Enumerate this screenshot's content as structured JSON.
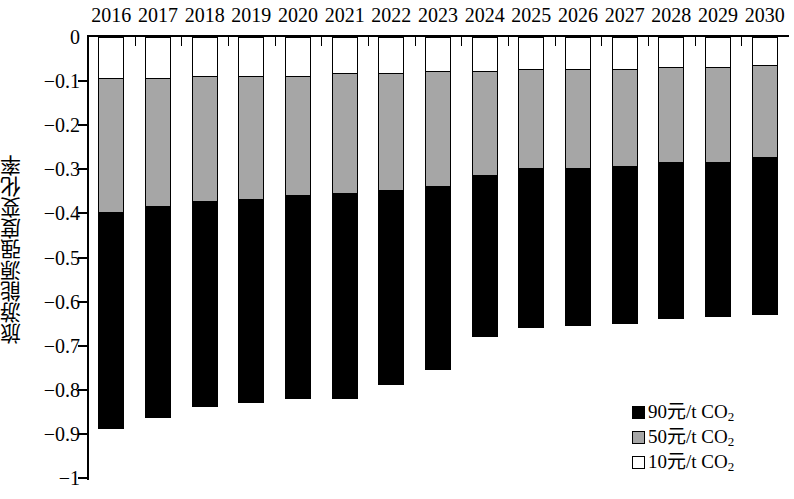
{
  "chart_data": {
    "type": "bar",
    "stacked": true,
    "orientation": "vertical-negative",
    "title": "",
    "subtitle": "",
    "xlabel": "",
    "ylabel": "旅游能源强度变化率",
    "xlim": [
      2016,
      2030
    ],
    "ylim": [
      -1,
      0
    ],
    "y_ticks": [
      "0",
      "−0.1",
      "−0.2",
      "−0.3",
      "−0.4",
      "−0.5",
      "−0.6",
      "−0.7",
      "−0.8",
      "−0.9",
      "−1"
    ],
    "y_tick_values": [
      0,
      -0.1,
      -0.2,
      -0.3,
      -0.4,
      -0.5,
      -0.6,
      -0.7,
      -0.8,
      -0.9,
      -1
    ],
    "grid": false,
    "x_axis_position": "top",
    "legend_position": "bottom-right",
    "categories": [
      "2016",
      "2017",
      "2018",
      "2019",
      "2020",
      "2021",
      "2022",
      "2023",
      "2024",
      "2025",
      "2026",
      "2027",
      "2028",
      "2029",
      "2030"
    ],
    "series": [
      {
        "name": "10元/t CO2",
        "color": "#ffffff",
        "legend_label_main": "10元/t CO",
        "legend_label_sub": "2",
        "values": [
          -0.095,
          -0.095,
          -0.09,
          -0.09,
          -0.09,
          -0.085,
          -0.085,
          -0.08,
          -0.08,
          -0.075,
          -0.075,
          -0.075,
          -0.07,
          -0.07,
          -0.065
        ]
      },
      {
        "name": "50元/t CO2",
        "color": "#a6a6a6",
        "legend_label_main": "50元/t CO",
        "legend_label_sub": "2",
        "values": [
          -0.4,
          -0.385,
          -0.375,
          -0.37,
          -0.36,
          -0.355,
          -0.35,
          -0.34,
          -0.315,
          -0.3,
          -0.3,
          -0.295,
          -0.285,
          -0.285,
          -0.275
        ]
      },
      {
        "name": "90元/t CO2",
        "color": "#000000",
        "legend_label_main": "90元/t CO",
        "legend_label_sub": "2",
        "values": [
          -0.89,
          -0.865,
          -0.84,
          -0.83,
          -0.82,
          -0.82,
          -0.79,
          -0.755,
          -0.68,
          -0.66,
          -0.655,
          -0.65,
          -0.64,
          -0.635,
          -0.63
        ]
      }
    ],
    "cumulative_boundaries_note": "Each series value is the cumulative lower edge of that stacked segment on the negative axis.",
    "legend_order_top_to_bottom": [
      "90元/t CO2",
      "50元/t CO2",
      "10元/t CO2"
    ]
  },
  "axis": {
    "y_title": "旅游能源强度变化率"
  }
}
